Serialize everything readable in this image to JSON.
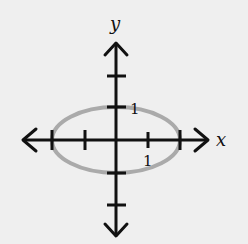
{
  "diagram": {
    "type": "ellipse-on-axes",
    "axes": {
      "x_label": "x",
      "y_label": "y",
      "x_ticks": [
        -2,
        -1,
        1,
        2
      ],
      "y_ticks": [
        -2,
        -1,
        1,
        2
      ],
      "tick_labels": {
        "x": "1",
        "y": "1"
      }
    },
    "ellipse": {
      "center": [
        0,
        0
      ],
      "semi_major_x": 2,
      "semi_minor_y": 1,
      "equation": "x^2/4 + y^2 = 1",
      "stroke_color": "#aaaaaa"
    },
    "axis_color": "#111111",
    "background": "#efefef"
  }
}
